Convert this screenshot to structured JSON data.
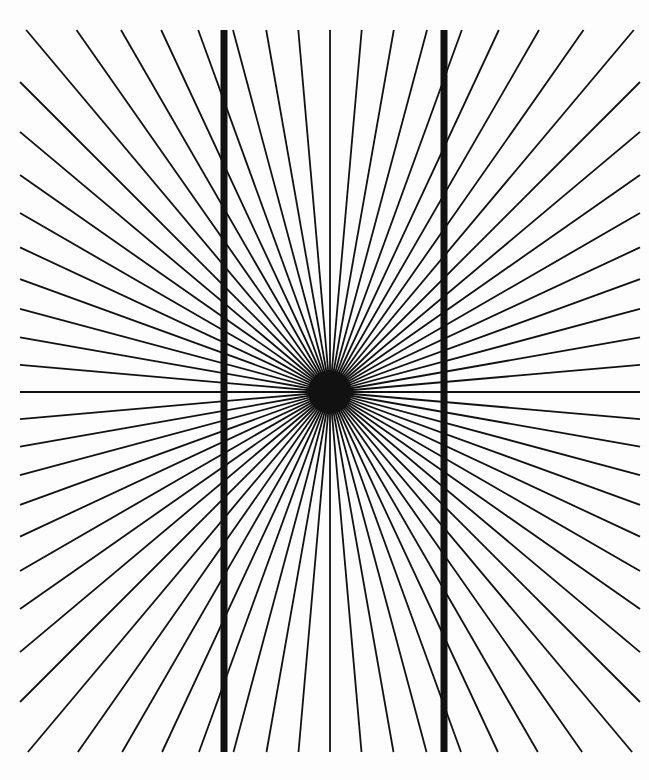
{
  "figure": {
    "name": "Hering illusion",
    "background": "#fdfdfd",
    "line_color": "#111111",
    "width": 649,
    "height": 780
  },
  "radial": {
    "center": [
      330,
      392
    ],
    "bounds": {
      "left": 20,
      "right": 640,
      "top": 30,
      "bottom": 752
    },
    "ray_count": 72,
    "ray_width": 1.8,
    "hub_radius": 22
  },
  "verticals": [
    {
      "x": 224,
      "y1": 30,
      "y2": 752,
      "width": 7
    },
    {
      "x": 444,
      "y1": 30,
      "y2": 752,
      "width": 7
    }
  ]
}
